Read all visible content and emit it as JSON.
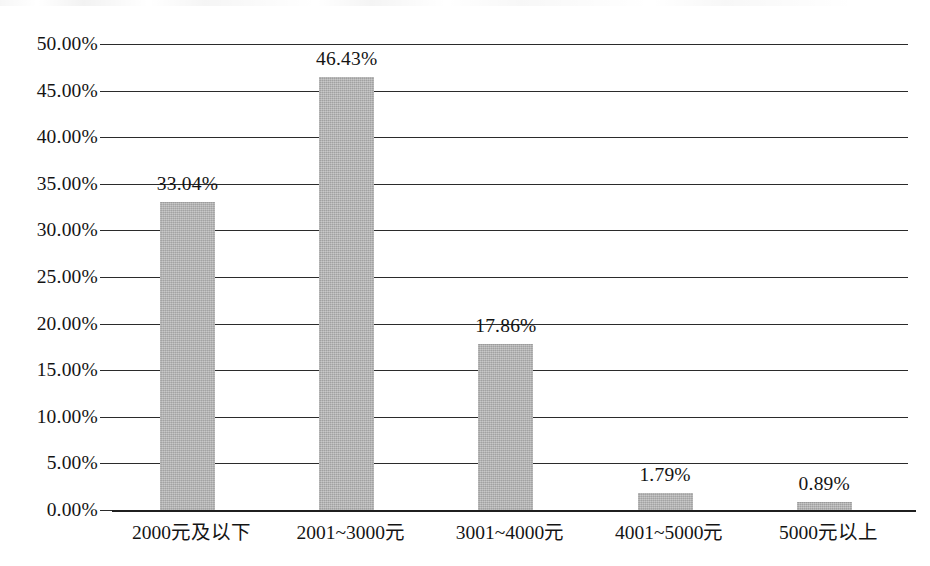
{
  "chart_data": {
    "type": "bar",
    "title": "",
    "subtitle": "",
    "xlabel": "",
    "ylabel": "",
    "categories": [
      "2000元及以下",
      "2001~3000元",
      "3001~4000元",
      "4001~5000元",
      "5000元以上"
    ],
    "values": [
      33.04,
      46.43,
      17.86,
      1.79,
      0.89
    ],
    "value_labels": [
      "33.04%",
      "46.43%",
      "17.86%",
      "1.79%",
      "0.89%"
    ],
    "ylim": [
      0,
      50
    ],
    "ytick_values": [
      0,
      5,
      10,
      15,
      20,
      25,
      30,
      35,
      40,
      45,
      50
    ],
    "ytick_labels": [
      "0.00%",
      "5.00%",
      "10.00%",
      "15.00%",
      "20.00%",
      "25.00%",
      "30.00%",
      "35.00%",
      "40.00%",
      "45.00%",
      "50.00%"
    ],
    "ytick_step": 5,
    "grid": "horizontal",
    "legend": "none",
    "series": [
      {
        "name": "",
        "values": [
          33.04,
          46.43,
          17.86,
          1.79,
          0.89
        ]
      }
    ],
    "colors": {
      "bar_fill": "#b2b2b2",
      "gridline": "#2b2b2b",
      "axis": "#1f1f1f",
      "text": "#141414",
      "background": "#ffffff"
    }
  },
  "bars": [
    {
      "category": "2000元及以下",
      "value": 33.04,
      "label": "33.04%"
    },
    {
      "category": "2001~3000元",
      "value": 46.43,
      "label": "46.43%"
    },
    {
      "category": "3001~4000元",
      "value": 17.86,
      "label": "17.86%"
    },
    {
      "category": "4001~5000元",
      "value": 1.79,
      "label": "1.79%"
    },
    {
      "category": "5000元以上",
      "value": 0.89,
      "label": "0.89%"
    }
  ],
  "yticks": [
    {
      "label": "50.00%",
      "value": 50
    },
    {
      "label": "45.00%",
      "value": 45
    },
    {
      "label": "40.00%",
      "value": 40
    },
    {
      "label": "35.00%",
      "value": 35
    },
    {
      "label": "30.00%",
      "value": 30
    },
    {
      "label": "25.00%",
      "value": 25
    },
    {
      "label": "20.00%",
      "value": 20
    },
    {
      "label": "15.00%",
      "value": 15
    },
    {
      "label": "10.00%",
      "value": 10
    },
    {
      "label": "5.00%",
      "value": 5
    },
    {
      "label": "0.00%",
      "value": 0
    }
  ]
}
